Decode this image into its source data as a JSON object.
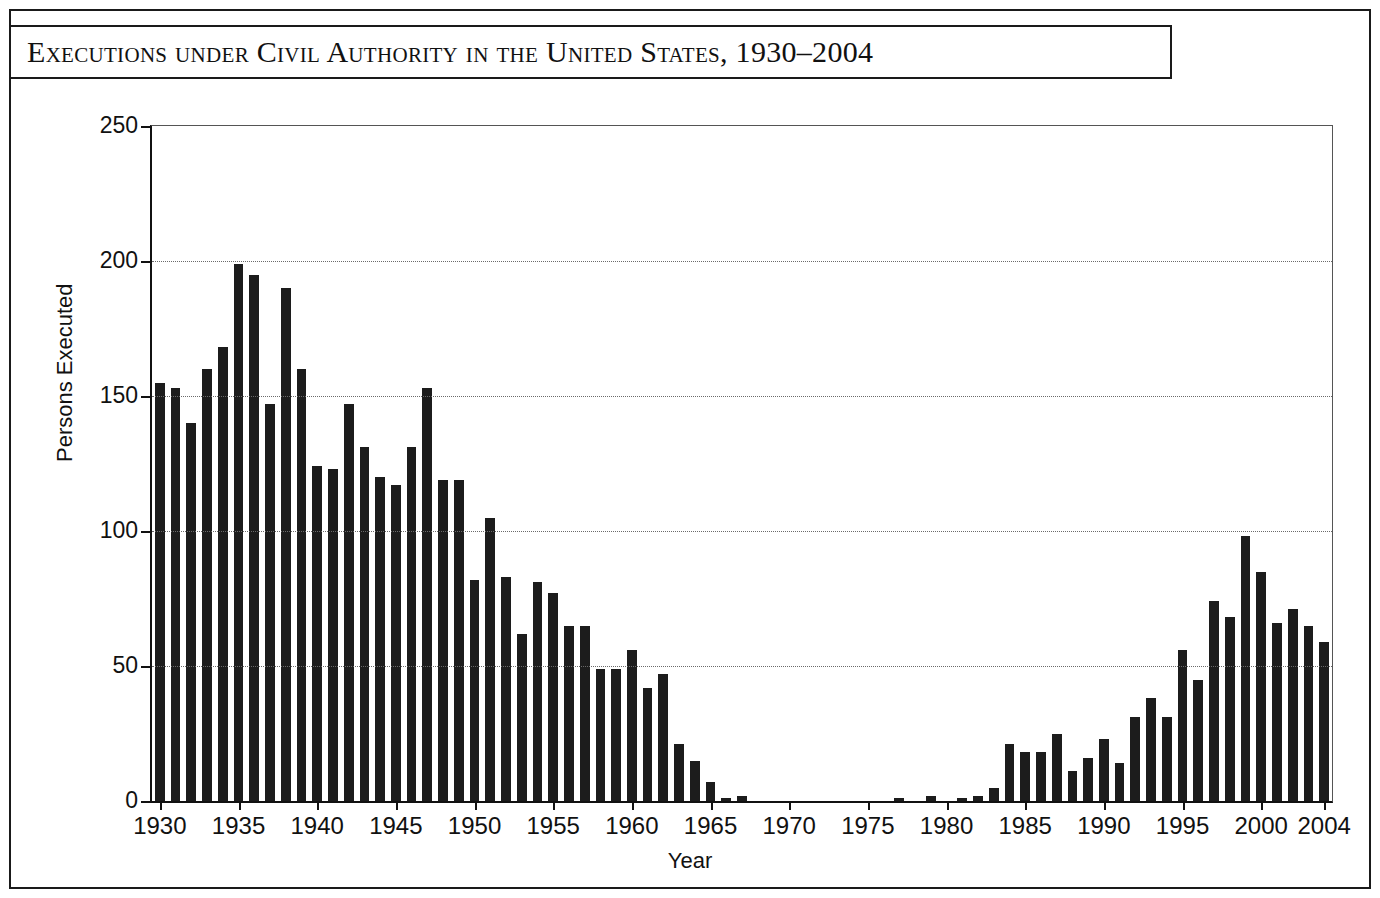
{
  "figure": {
    "title": "Executions under Civil Authority in the United States, 1930–2004",
    "frame_color": "#1a1a1a",
    "bar_color": "#1c1c1c",
    "background": "#ffffff"
  },
  "chart_data": {
    "type": "bar",
    "title": "Executions under Civil Authority in the United States, 1930–2004",
    "xlabel": "Year",
    "ylabel": "Persons Executed",
    "xlim": [
      1929.5,
      2004.5
    ],
    "ylim": [
      0,
      250
    ],
    "ytick_labels": [
      "0",
      "50",
      "100",
      "150",
      "200",
      "250"
    ],
    "yticks": [
      0,
      50,
      100,
      150,
      200,
      250
    ],
    "xtick_labels": [
      "1930",
      "1935",
      "1940",
      "1945",
      "1950",
      "1955",
      "1960",
      "1965",
      "1970",
      "1975",
      "1980",
      "1985",
      "1990",
      "1995",
      "2000",
      "2004"
    ],
    "xticks": [
      1930,
      1935,
      1940,
      1945,
      1950,
      1955,
      1960,
      1965,
      1970,
      1975,
      1980,
      1985,
      1990,
      1995,
      2000,
      2004
    ],
    "grid": "horizontal-dotted",
    "legend": null,
    "categories": [
      1930,
      1931,
      1932,
      1933,
      1934,
      1935,
      1936,
      1937,
      1938,
      1939,
      1940,
      1941,
      1942,
      1943,
      1944,
      1945,
      1946,
      1947,
      1948,
      1949,
      1950,
      1951,
      1952,
      1953,
      1954,
      1955,
      1956,
      1957,
      1958,
      1959,
      1960,
      1961,
      1962,
      1963,
      1964,
      1965,
      1966,
      1967,
      1968,
      1969,
      1970,
      1971,
      1972,
      1973,
      1974,
      1975,
      1976,
      1977,
      1978,
      1979,
      1980,
      1981,
      1982,
      1983,
      1984,
      1985,
      1986,
      1987,
      1988,
      1989,
      1990,
      1991,
      1992,
      1993,
      1994,
      1995,
      1996,
      1997,
      1998,
      1999,
      2000,
      2001,
      2002,
      2003,
      2004
    ],
    "values": [
      155,
      153,
      140,
      160,
      168,
      199,
      195,
      147,
      190,
      160,
      124,
      123,
      147,
      131,
      120,
      117,
      131,
      153,
      119,
      119,
      82,
      105,
      83,
      62,
      81,
      77,
      65,
      65,
      49,
      49,
      56,
      42,
      47,
      21,
      15,
      7,
      1,
      2,
      0,
      0,
      0,
      0,
      0,
      0,
      0,
      0,
      0,
      1,
      0,
      2,
      0,
      1,
      2,
      5,
      21,
      18,
      18,
      25,
      11,
      16,
      23,
      14,
      31,
      38,
      31,
      56,
      45,
      74,
      68,
      98,
      85,
      66,
      71,
      65,
      59
    ]
  }
}
